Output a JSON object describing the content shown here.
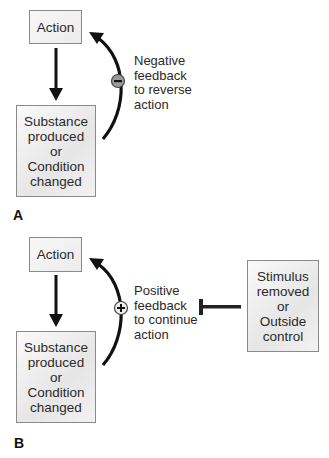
{
  "panels": [
    {
      "letter": "A",
      "action_box": "Action",
      "result_box": "Substance\nproduced\nor\nCondition\nchanged",
      "feedback_label": "Negative\nfeedback\nto reverse\naction",
      "feedback_symbol": "minus-icon",
      "feedback_type": "negative"
    },
    {
      "letter": "B",
      "action_box": "Action",
      "result_box": "Substance\nproduced\nor\nCondition\nchanged",
      "feedback_label": "Positive\nfeedback\nto continue\naction",
      "feedback_symbol": "plus-icon",
      "feedback_type": "positive",
      "inhibitor_box": "Stimulus\nremoved\nor\nOutside\ncontrol"
    }
  ],
  "colors": {
    "arrow": "#111111",
    "box_border": "#8a8a8a",
    "box_fill": "#e6e6e6",
    "minus_circle_fill": "#9a9a9a",
    "plus_circle_fill": "#e8e8e8"
  }
}
